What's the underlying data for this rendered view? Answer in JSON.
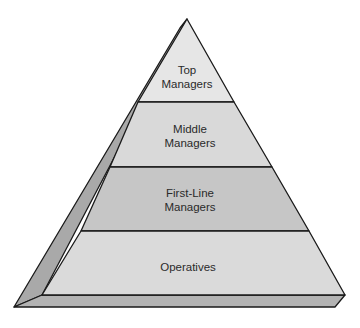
{
  "diagram": {
    "type": "pyramid",
    "layers": [
      {
        "id": "top",
        "line1": "Top",
        "line2": "Managers",
        "fill": "#e6e6e6"
      },
      {
        "id": "middle",
        "line1": "Middle",
        "line2": "Managers",
        "fill": "#d9d9d9"
      },
      {
        "id": "first-line",
        "line1": "First-Line",
        "line2": "Managers",
        "fill": "#c6c6c6"
      },
      {
        "id": "operatives",
        "line1": "Operatives",
        "line2": "",
        "fill": "#dadada"
      }
    ],
    "colors": {
      "outline": "#1a1a1a",
      "side_face": "#a9a9a9",
      "base_slab": "#b3b3b3"
    }
  }
}
